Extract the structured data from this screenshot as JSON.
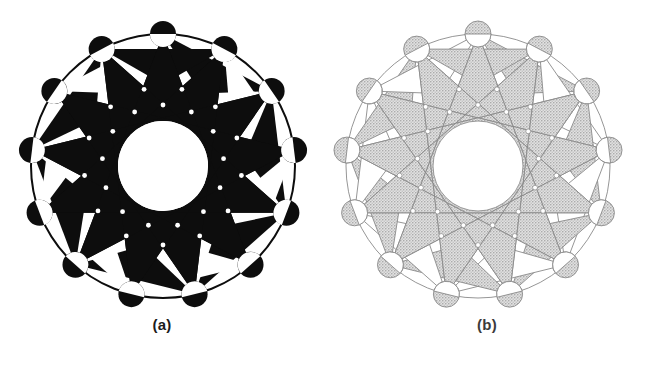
{
  "plate": {
    "width": 649,
    "height": 375,
    "background_color": "#ffffff",
    "description": "Two versions of a thirteen-pointed star-polygon rosette: solid black fill and light stippled gray fill"
  },
  "panels": [
    {
      "id": "a",
      "caption": "(a)",
      "fill_color": "#0d0d0d",
      "stroke_color": "#0d0d0d",
      "stroke_width": 0,
      "rendering": "solid black fill, no outline",
      "center": {
        "x": 163,
        "y": 166
      },
      "outer_radius": 132,
      "inner_circle_radius": 45,
      "vertex_count": 13,
      "vertex_circle_radius": 13,
      "star_step": 5,
      "dot_radius": 2.4,
      "dot_color": "#ffffff"
    },
    {
      "id": "b",
      "caption": "(b)",
      "fill_color": "#c9c9c9",
      "stroke_color": "#8a8a8a",
      "stroke_width": 0.9,
      "rendering": "light gray stipple fill with thin outlines",
      "center": {
        "x": 153,
        "y": 166
      },
      "outer_radius": 132,
      "inner_circle_radius": 45,
      "vertex_count": 13,
      "vertex_circle_radius": 13,
      "star_step": 5,
      "dot_radius": 2.4,
      "dot_color": "#ffffff"
    }
  ],
  "colors": {
    "black": "#0d0d0d",
    "gray_fill": "#c9c9c9",
    "gray_stroke": "#8a8a8a",
    "white": "#ffffff",
    "caption_text": "#1b1b1b"
  }
}
